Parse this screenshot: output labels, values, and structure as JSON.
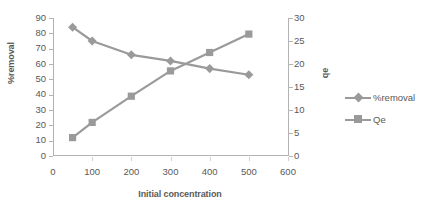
{
  "chart_data": {
    "type": "line",
    "title": "",
    "xlabel": "Initial concentration",
    "ylabel": "%removal",
    "y2label": "qe",
    "x": [
      50,
      100,
      200,
      300,
      400,
      500
    ],
    "xlim": [
      0,
      600
    ],
    "ylim": [
      0,
      90
    ],
    "y2lim": [
      0,
      30
    ],
    "xticks": [
      "0",
      "100",
      "200",
      "300",
      "400",
      "500",
      "600"
    ],
    "yticks": [
      "0",
      "10",
      "20",
      "30",
      "40",
      "50",
      "60",
      "70",
      "80",
      "90"
    ],
    "y2ticks": [
      "0",
      "5",
      "10",
      "15",
      "20",
      "25",
      "30"
    ],
    "grid": false,
    "legend_position": "right",
    "series": [
      {
        "name": "%removal",
        "axis": "left",
        "marker": "diamond",
        "color": "#9a9a9a",
        "values": [
          84,
          75,
          66,
          62,
          57,
          53
        ]
      },
      {
        "name": "Qe",
        "axis": "right",
        "marker": "square",
        "color": "#9a9a9a",
        "values": [
          4,
          7.3,
          13,
          18.5,
          22.5,
          26.5
        ]
      }
    ]
  },
  "legend": {
    "items": [
      {
        "label": "%removal",
        "marker": "diamond"
      },
      {
        "label": "Qe",
        "marker": "square"
      }
    ]
  },
  "colors": {
    "series": "#9a9a9a",
    "axis": "#b3b3b3",
    "text": "#595959",
    "background": "#ffffff"
  }
}
